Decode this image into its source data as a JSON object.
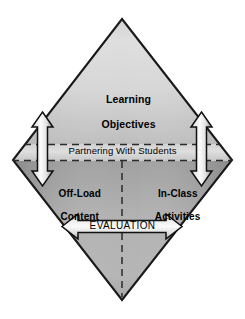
{
  "figure": {
    "type": "diagram",
    "shape": "diamond",
    "background_color": "#ffffff",
    "outline_color": "#1a1a1a"
  },
  "diamond": {
    "top_region": {
      "label": "Learning\nObjectives",
      "fill_light": "#e2e2e2",
      "fill_dark": "#b4b4b4"
    },
    "middle_band": {
      "label": "Partnering With Students",
      "fill_light": "#dcdcdc",
      "border_style": "dashed",
      "border_color": "#2b2b2b"
    },
    "bottom_left_region": {
      "label": "Off-Load\nContent",
      "fill_light": "#b8b8b8",
      "fill_dark": "#8c8c8c"
    },
    "bottom_right_region": {
      "label": "In-Class\nActivities",
      "fill_light": "#b8b8b8",
      "fill_dark": "#8c8c8c"
    },
    "center_divider": {
      "style": "dashed",
      "color": "#2b2b2b",
      "orientation": "vertical"
    }
  },
  "arrows": {
    "left_vertical": {
      "name": "left-vertical-double-arrow",
      "direction": "double-vertical",
      "fill_light": "#f2f2f2",
      "fill_dark": "#9a9a9a",
      "stroke": "#111111"
    },
    "right_vertical": {
      "name": "right-vertical-double-arrow",
      "direction": "double-vertical",
      "fill_light": "#f2f2f2",
      "fill_dark": "#9a9a9a",
      "stroke": "#111111"
    },
    "center_horizontal": {
      "name": "evaluation-double-arrow",
      "direction": "double-horizontal",
      "label": "EVALUATION",
      "fill_light": "#f2f2f2",
      "fill_dark": "#a8a8a8",
      "stroke": "#111111"
    }
  },
  "labels": {
    "learning_objectives_line1": "Learning",
    "learning_objectives_line2": "Objectives",
    "partnering": "Partnering With Students",
    "offload_line1": "Off-Load",
    "offload_line2": "Content",
    "inclass_line1": "In-Class",
    "inclass_line2": "Activities",
    "evaluation": "EVALUATION"
  }
}
